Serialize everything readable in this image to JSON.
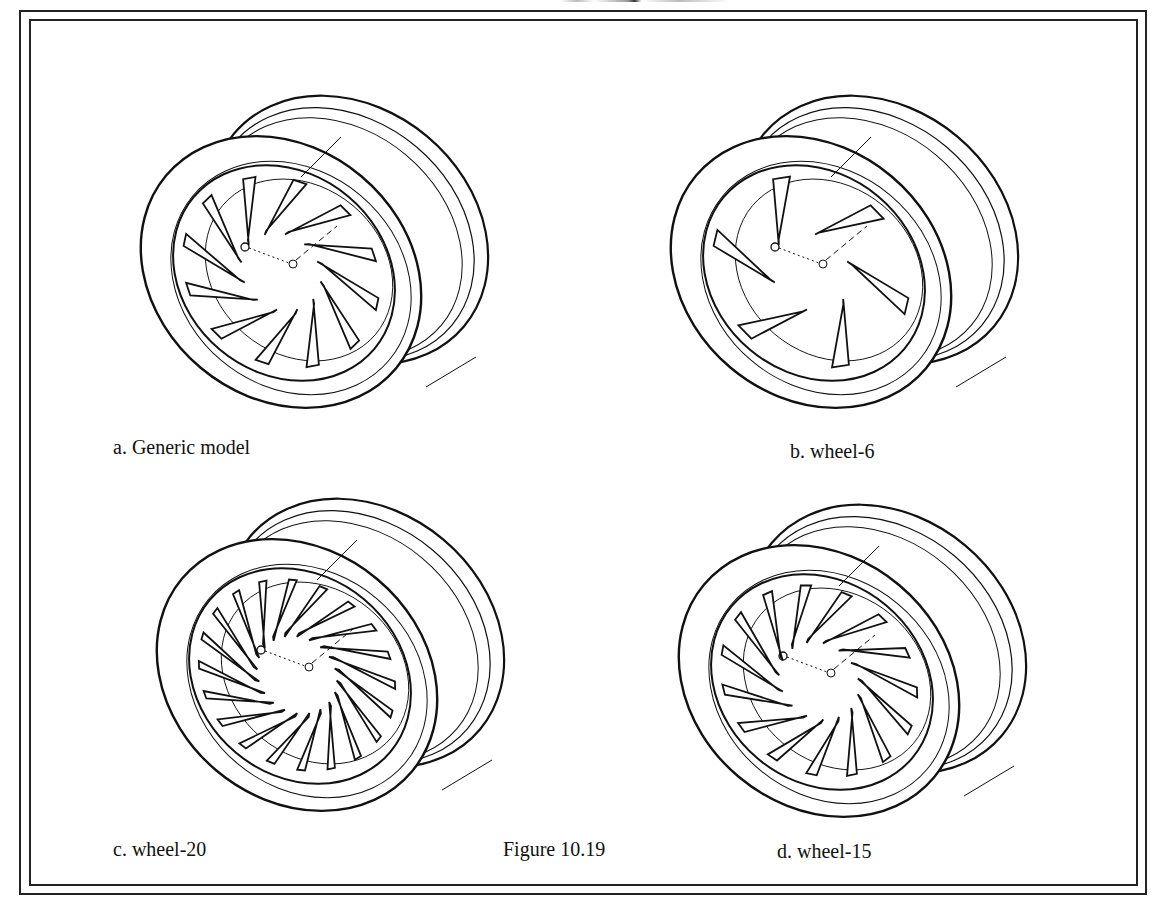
{
  "figure": {
    "caption": "Figure 10.19",
    "panels": [
      {
        "id": "a",
        "label": "a. Generic model",
        "blades": 12
      },
      {
        "id": "b",
        "label": "b. wheel-6",
        "blades": 6
      },
      {
        "id": "c",
        "label": "c. wheel-20",
        "blades": 20
      },
      {
        "id": "d",
        "label": "d. wheel-15",
        "blades": 15
      }
    ]
  }
}
